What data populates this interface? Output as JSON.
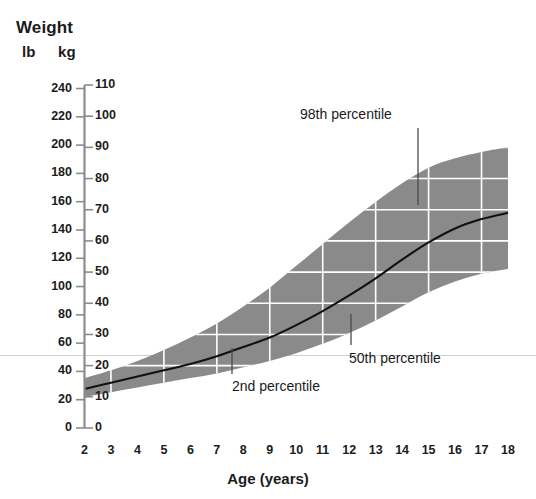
{
  "chart_data": {
    "type": "area",
    "title": "Weight",
    "xlabel": "Age (years)",
    "ylabel": "Weight",
    "units": {
      "left": "lb",
      "right": "kg"
    },
    "xlim": [
      2,
      18
    ],
    "x_ticks": [
      2,
      3,
      4,
      5,
      6,
      7,
      8,
      9,
      10,
      11,
      12,
      13,
      14,
      15,
      16,
      17,
      18
    ],
    "ylim_kg": [
      0,
      110
    ],
    "ylim_lb": [
      0,
      240
    ],
    "y_ticks_kg": [
      0,
      10,
      20,
      30,
      40,
      50,
      60,
      70,
      80,
      90,
      100,
      110
    ],
    "y_ticks_lb": [
      0,
      20,
      40,
      60,
      80,
      100,
      120,
      140,
      160,
      180,
      200,
      220,
      240
    ],
    "grid": "white gridlines inside shaded band only",
    "legend": "none",
    "x": [
      2,
      3,
      4,
      5,
      6,
      7,
      8,
      9,
      10,
      11,
      12,
      13,
      14,
      15,
      16,
      17,
      18
    ],
    "series": [
      {
        "name": "98th percentile",
        "units": "kg",
        "values": [
          16.0,
          18.5,
          21.5,
          25.0,
          29.0,
          33.5,
          39.0,
          45.0,
          52.0,
          59.0,
          66.0,
          72.5,
          78.5,
          83.5,
          86.5,
          88.5,
          90.0
        ]
      },
      {
        "name": "50th percentile",
        "units": "kg",
        "values": [
          12.5,
          14.5,
          16.5,
          18.5,
          20.5,
          23.0,
          26.0,
          29.0,
          33.0,
          37.5,
          42.5,
          48.0,
          54.0,
          59.5,
          64.0,
          67.0,
          69.0
        ]
      },
      {
        "name": "2nd percentile",
        "units": "kg",
        "values": [
          10.0,
          11.5,
          13.0,
          14.5,
          16.0,
          17.5,
          19.5,
          21.5,
          24.0,
          27.0,
          30.5,
          34.5,
          39.0,
          43.5,
          47.0,
          49.5,
          51.0
        ]
      }
    ],
    "annotations": [
      {
        "text": "98th percentile",
        "points_to": "upper edge of shaded band near age 15"
      },
      {
        "text": "50th percentile",
        "points_to": "median curve near age 12"
      },
      {
        "text": "2nd percentile",
        "points_to": "lower edge of shaded band near age 7.5"
      }
    ],
    "colors": {
      "band": "#8a8a8a",
      "gridline": "#ffffff",
      "median_curve": "#111111",
      "axis": "#8c8c8c",
      "text": "#1b1b1b",
      "background": "#ffffff"
    }
  },
  "header": {
    "title": "Weight",
    "unit_left": "lb",
    "unit_right": "kg"
  },
  "axes": {
    "x_title": "Age (years)",
    "x_tick_labels": [
      "2",
      "3",
      "4",
      "5",
      "6",
      "7",
      "8",
      "9",
      "10",
      "11",
      "12",
      "13",
      "14",
      "15",
      "16",
      "17",
      "18"
    ],
    "y_lb_labels": [
      "240",
      "220",
      "200",
      "180",
      "160",
      "140",
      "120",
      "100",
      "80",
      "60",
      "40",
      "20",
      "0"
    ],
    "y_kg_labels": [
      "110",
      "100",
      "90",
      "80",
      "70",
      "60",
      "50",
      "40",
      "30",
      "20",
      "10",
      "0"
    ]
  },
  "annotations": {
    "p98": "98th percentile",
    "p50": "50th percentile",
    "p2": "2nd percentile"
  }
}
